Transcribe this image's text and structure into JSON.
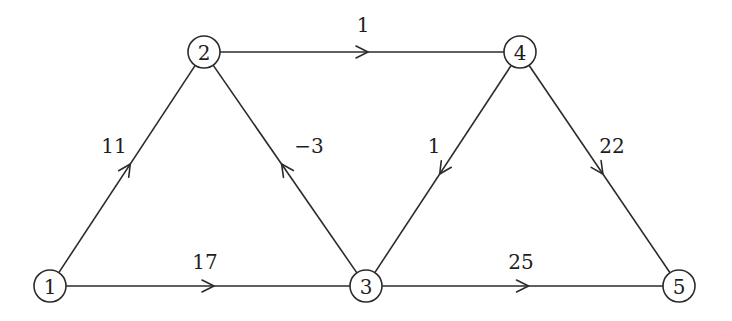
{
  "graph": {
    "type": "directed-weighted-graph",
    "node_radius": 16,
    "stroke_color": "#2b2b2b",
    "background": "#ffffff",
    "nodes": [
      {
        "id": "1",
        "label": "1",
        "x": 50,
        "y": 286
      },
      {
        "id": "2",
        "label": "2",
        "x": 204,
        "y": 52
      },
      {
        "id": "3",
        "label": "3",
        "x": 366,
        "y": 286
      },
      {
        "id": "4",
        "label": "4",
        "x": 520,
        "y": 52
      },
      {
        "id": "5",
        "label": "5",
        "x": 679,
        "y": 286
      }
    ],
    "edges": [
      {
        "from": "1",
        "to": "2",
        "weight": "11",
        "label_x": 114,
        "label_y": 146
      },
      {
        "from": "2",
        "to": "4",
        "weight": "1",
        "label_x": 363,
        "label_y": 25
      },
      {
        "from": "3",
        "to": "2",
        "weight": "−3",
        "label_x": 309,
        "label_y": 146
      },
      {
        "from": "4",
        "to": "3",
        "weight": "1",
        "label_x": 434,
        "label_y": 146
      },
      {
        "from": "4",
        "to": "5",
        "weight": "22",
        "label_x": 612,
        "label_y": 146
      },
      {
        "from": "1",
        "to": "3",
        "weight": "17",
        "label_x": 205,
        "label_y": 262
      },
      {
        "from": "3",
        "to": "5",
        "weight": "25",
        "label_x": 521,
        "label_y": 262
      }
    ]
  }
}
